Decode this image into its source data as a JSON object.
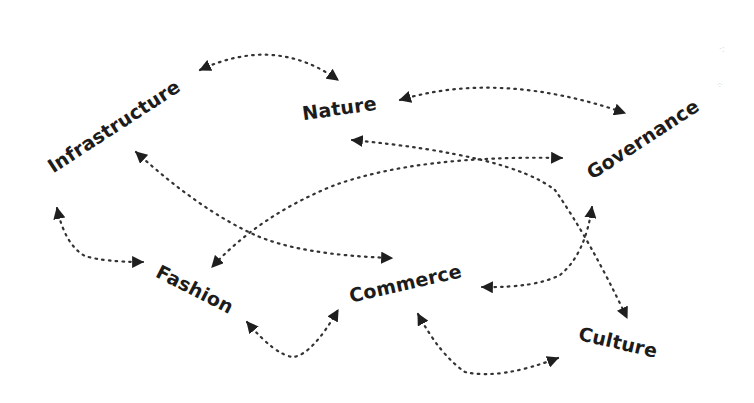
{
  "diagram": {
    "type": "concept-map",
    "nodes": [
      {
        "id": "infrastructure",
        "label": "Infrastructure",
        "x": 117,
        "y": 128,
        "angle": -33
      },
      {
        "id": "nature",
        "label": "Nature",
        "x": 342,
        "y": 108,
        "angle": -8
      },
      {
        "id": "governance",
        "label": "Governance",
        "x": 640,
        "y": 140,
        "angle": -33
      },
      {
        "id": "fashion",
        "label": "Fashion",
        "x": 196,
        "y": 290,
        "angle": 27
      },
      {
        "id": "commerce",
        "label": "Commerce",
        "x": 405,
        "y": 285,
        "angle": -13
      },
      {
        "id": "culture",
        "label": "Culture",
        "x": 618,
        "y": 343,
        "angle": 13
      }
    ],
    "edges": [
      {
        "from": "infrastructure",
        "to": "nature",
        "bidirectional": true
      },
      {
        "from": "nature",
        "to": "governance",
        "bidirectional": true
      },
      {
        "from": "infrastructure",
        "to": "commerce",
        "bidirectional": true
      },
      {
        "from": "governance",
        "to": "fashion",
        "bidirectional": true
      },
      {
        "from": "nature",
        "to": "culture",
        "bidirectional": true
      },
      {
        "from": "governance",
        "to": "commerce",
        "bidirectional": true
      },
      {
        "from": "infrastructure",
        "to": "fashion",
        "bidirectional": true
      },
      {
        "from": "fashion",
        "to": "commerce",
        "bidirectional": true
      },
      {
        "from": "commerce",
        "to": "culture",
        "bidirectional": true
      }
    ],
    "colors": {
      "line": "#333333",
      "text": "#1c1c1c",
      "background": "#ffffff"
    }
  }
}
